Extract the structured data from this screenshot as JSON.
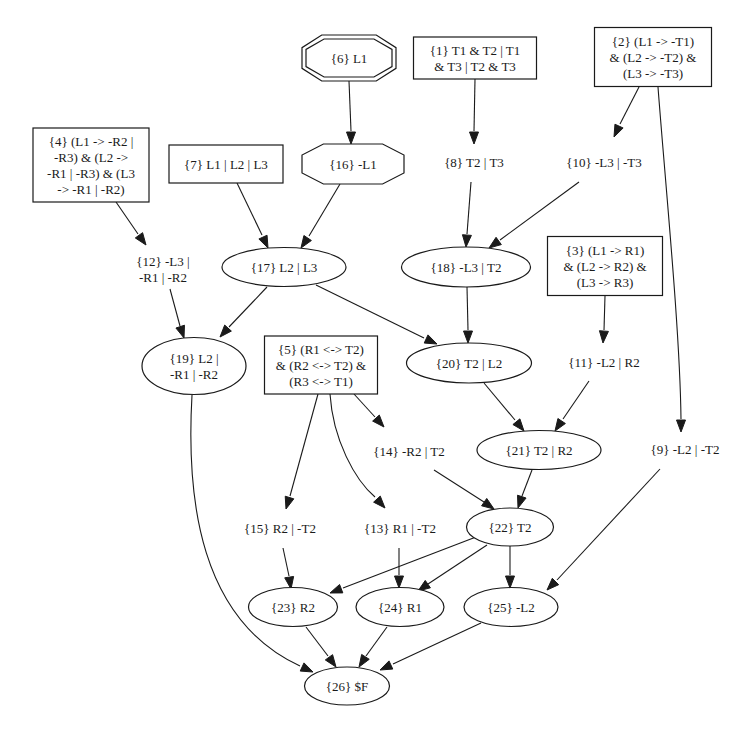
{
  "diagram": {
    "type": "directed-graph",
    "nodes": [
      {
        "id": "1",
        "shape": "box",
        "x": 475,
        "y": 58,
        "w": 123,
        "h": 42,
        "lines": [
          "{1} T1 & T2 | T1",
          "& T3 | T2 & T3"
        ]
      },
      {
        "id": "2",
        "shape": "box",
        "x": 653,
        "y": 57,
        "w": 117,
        "h": 59,
        "lines": [
          "{2} (L1 -> -T1)",
          "& (L2 -> -T2) &",
          "(L3 -> -T3)"
        ]
      },
      {
        "id": "3",
        "shape": "box",
        "x": 605,
        "y": 266,
        "w": 115,
        "h": 59,
        "lines": [
          "{3} (L1 -> R1)",
          "& (L2 -> R2) &",
          "(L3 -> R3)"
        ]
      },
      {
        "id": "4",
        "shape": "box",
        "x": 91,
        "y": 165,
        "w": 116,
        "h": 74,
        "lines": [
          "{4} (L1 -> -R2 |",
          "-R3) & (L2 ->",
          "-R1 | -R3) & (L3",
          "-> -R1 | -R2)"
        ]
      },
      {
        "id": "5",
        "shape": "box",
        "x": 321,
        "y": 365,
        "w": 113,
        "h": 58,
        "lines": [
          "{5} (R1 <-> T2)",
          "& (R2 <-> T2) &",
          "(R3 <-> T1)"
        ]
      },
      {
        "id": "6",
        "shape": "doubleoctagon",
        "x": 349,
        "y": 58,
        "w": 94,
        "h": 46,
        "lines": [
          "{6} L1"
        ]
      },
      {
        "id": "7",
        "shape": "box",
        "x": 226,
        "y": 164,
        "w": 114,
        "h": 38,
        "lines": [
          "{7} L1 | L2 | L3"
        ]
      },
      {
        "id": "8",
        "shape": "plaintext",
        "x": 474,
        "y": 162,
        "lines": [
          "{8} T2 | T3"
        ]
      },
      {
        "id": "9",
        "shape": "plaintext",
        "x": 685,
        "y": 449,
        "lines": [
          "{9} -L2 | -T2"
        ]
      },
      {
        "id": "10",
        "shape": "plaintext",
        "x": 604,
        "y": 162,
        "lines": [
          "{10} -L3 | -T3"
        ]
      },
      {
        "id": "11",
        "shape": "plaintext",
        "x": 604,
        "y": 362,
        "lines": [
          "{11} -L2 | R2"
        ]
      },
      {
        "id": "12",
        "shape": "plaintext",
        "x": 163,
        "y": 269,
        "lines": [
          "{12} -L3 |",
          "-R1 | -R2"
        ]
      },
      {
        "id": "13",
        "shape": "plaintext",
        "x": 400,
        "y": 528,
        "lines": [
          "{13} R1 | -T2"
        ]
      },
      {
        "id": "14",
        "shape": "plaintext",
        "x": 409,
        "y": 451,
        "lines": [
          "{14} -R2 | T2"
        ]
      },
      {
        "id": "15",
        "shape": "plaintext",
        "x": 280,
        "y": 528,
        "lines": [
          "{15} R2 | -T2"
        ]
      },
      {
        "id": "16",
        "shape": "octagon",
        "x": 353,
        "y": 164,
        "w": 102,
        "h": 40,
        "lines": [
          "{16} -L1"
        ]
      },
      {
        "id": "17",
        "shape": "ellipse",
        "x": 284,
        "y": 267,
        "w": 124,
        "h": 39,
        "lines": [
          "{17} L2 | L3"
        ]
      },
      {
        "id": "18",
        "shape": "ellipse",
        "x": 466,
        "y": 267,
        "w": 129,
        "h": 40,
        "lines": [
          "{18} -L3 | T2"
        ]
      },
      {
        "id": "19",
        "shape": "ellipse",
        "x": 194,
        "y": 366,
        "w": 104,
        "h": 57,
        "lines": [
          "{19} L2 |",
          "-R1 | -R2"
        ]
      },
      {
        "id": "20",
        "shape": "ellipse",
        "x": 469,
        "y": 363,
        "w": 125,
        "h": 40,
        "lines": [
          "{20} T2 | L2"
        ]
      },
      {
        "id": "21",
        "shape": "ellipse",
        "x": 539,
        "y": 450,
        "w": 124,
        "h": 39,
        "lines": [
          "{21} T2 | R2"
        ]
      },
      {
        "id": "22",
        "shape": "ellipse",
        "x": 510,
        "y": 527,
        "w": 87,
        "h": 38,
        "lines": [
          "{22} T2"
        ]
      },
      {
        "id": "23",
        "shape": "ellipse",
        "x": 293,
        "y": 607,
        "w": 89,
        "h": 39,
        "lines": [
          "{23} R2"
        ]
      },
      {
        "id": "24",
        "shape": "ellipse",
        "x": 400,
        "y": 607,
        "w": 88,
        "h": 39,
        "lines": [
          "{24} R1"
        ]
      },
      {
        "id": "25",
        "shape": "ellipse",
        "x": 511,
        "y": 607,
        "w": 94,
        "h": 39,
        "lines": [
          "{25} -L2"
        ]
      },
      {
        "id": "26",
        "shape": "ellipse",
        "x": 347,
        "y": 686,
        "w": 85,
        "h": 38,
        "lines": [
          "{26} $F"
        ]
      }
    ],
    "edges": [
      {
        "from": "6",
        "to": "16",
        "path": "M349,81 L351,131",
        "tip": [
          351,
          144
        ]
      },
      {
        "from": "1",
        "to": "8",
        "path": "M475,79 L474,131",
        "tip": [
          474,
          144
        ]
      },
      {
        "from": "2",
        "to": "10",
        "path": "M639,87 L620,124",
        "tip": [
          614,
          137
        ]
      },
      {
        "from": "2",
        "to": "9",
        "path": "M658,87 C665,180 680,330 681,419",
        "tip": [
          681,
          432
        ]
      },
      {
        "from": "4",
        "to": "12",
        "path": "M116,202 L138,234",
        "tip": [
          146,
          245
        ]
      },
      {
        "from": "7",
        "to": "17",
        "path": "M237,183 L262,235",
        "tip": [
          268,
          248
        ]
      },
      {
        "from": "16",
        "to": "17",
        "path": "M340,184 L309,236",
        "tip": [
          301,
          248
        ]
      },
      {
        "from": "8",
        "to": "18",
        "path": "M471,182 L467,234",
        "tip": [
          466,
          247
        ]
      },
      {
        "from": "10",
        "to": "18",
        "path": "M579,182 L500,240",
        "tip": [
          489,
          248
        ]
      },
      {
        "from": "12",
        "to": "19",
        "path": "M170,289 L180,326",
        "tip": [
          184,
          338
        ]
      },
      {
        "from": "17",
        "to": "19",
        "path": "M267,287 L229,327",
        "tip": [
          220,
          337
        ]
      },
      {
        "from": "17",
        "to": "20",
        "path": "M316,285 L424,338",
        "tip": [
          437,
          344
        ]
      },
      {
        "from": "18",
        "to": "20",
        "path": "M467,287 L468,330",
        "tip": [
          468,
          343
        ]
      },
      {
        "from": "3",
        "to": "11",
        "path": "M605,296 L604,330",
        "tip": [
          603,
          343
        ]
      },
      {
        "from": "20",
        "to": "21",
        "path": "M484,383 L515,420",
        "tip": [
          524,
          431
        ]
      },
      {
        "from": "11",
        "to": "21",
        "path": "M589,381 L563,419",
        "tip": [
          555,
          431
        ]
      },
      {
        "from": "5",
        "to": "14",
        "path": "M354,394 L375,417",
        "tip": [
          384,
          427
        ]
      },
      {
        "from": "5",
        "to": "15",
        "path": "M318,394 L290,496",
        "tip": [
          286,
          509
        ]
      },
      {
        "from": "5",
        "to": "13",
        "path": "M330,394 C333,440 355,480 375,497",
        "tip": [
          385,
          508
        ]
      },
      {
        "from": "14",
        "to": "22",
        "path": "M434,470 L484,502",
        "tip": [
          494,
          509
        ]
      },
      {
        "from": "21",
        "to": "22",
        "path": "M532,470 L522,496",
        "tip": [
          518,
          508
        ]
      },
      {
        "from": "15",
        "to": "23",
        "path": "M283,548 L289,576",
        "tip": [
          291,
          589
        ]
      },
      {
        "from": "13",
        "to": "24",
        "path": "M399,548 L399,575",
        "tip": [
          399,
          588
        ]
      },
      {
        "from": "22",
        "to": "23",
        "path": "M476,537 L343,588",
        "tip": [
          330,
          593
        ]
      },
      {
        "from": "22",
        "to": "24",
        "path": "M487,545 L428,584",
        "tip": [
          418,
          591
        ]
      },
      {
        "from": "22",
        "to": "25",
        "path": "M510,546 L510,575",
        "tip": [
          510,
          588
        ]
      },
      {
        "from": "9",
        "to": "25",
        "path": "M660,469 L557,580",
        "tip": [
          547,
          590
        ]
      },
      {
        "from": "19",
        "to": "26",
        "path": "M192,395 C186,500 200,620 300,666",
        "tip": [
          313,
          672
        ]
      },
      {
        "from": "23",
        "to": "26",
        "path": "M306,627 L328,656",
        "tip": [
          336,
          667
        ]
      },
      {
        "from": "24",
        "to": "26",
        "path": "M387,627 L366,656",
        "tip": [
          359,
          667
        ]
      },
      {
        "from": "25",
        "to": "26",
        "path": "M481,623 L393,664",
        "tip": [
          380,
          670
        ]
      }
    ]
  }
}
